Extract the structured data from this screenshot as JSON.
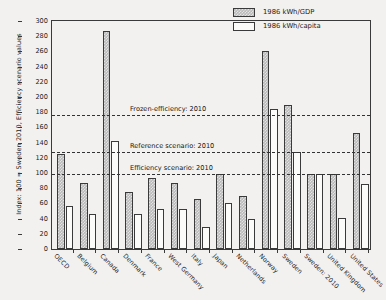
{
  "chart_data": {
    "type": "bar",
    "title": "",
    "xlabel": "",
    "ylabel": "Index: 100 = Sweden 2010, Efficiency scenario values",
    "ylim": [
      0,
      300
    ],
    "yticks": [
      0,
      20,
      40,
      60,
      80,
      100,
      120,
      140,
      160,
      180,
      200,
      220,
      240,
      260,
      280,
      300
    ],
    "grid": false,
    "legend_position": "top-right",
    "categories": [
      "OECD",
      "Belgium",
      "Canada",
      "Denmark",
      "France",
      "West Germany",
      "Italy",
      "Japan",
      "Netherlands",
      "Norway",
      "Sweden",
      "Sweden: 2010",
      "United Kingdom",
      "United States"
    ],
    "series": [
      {
        "name": "1986 kWh/GDP",
        "fill": "hatched-gray",
        "values": [
          125,
          87,
          287,
          75,
          94,
          87,
          66,
          99,
          70,
          260,
          190,
          99,
          99,
          152
        ]
      },
      {
        "name": "1986 kWh/capita",
        "fill": "white",
        "values": [
          57,
          46,
          142,
          46,
          52,
          52,
          29,
          60,
          39,
          184,
          128,
          99,
          41,
          86
        ]
      }
    ],
    "reference_lines": [
      {
        "label": "Frozen-efficiency: 2010",
        "value": 176
      },
      {
        "label": "Reference scenario: 2010",
        "value": 128
      },
      {
        "label": "Efficiency scenario: 2010",
        "value": 99
      }
    ],
    "colors": {
      "gdp_bar": "#b9b9b9",
      "capita_bar": "#fbfbf9",
      "axis": "#3a3a3a",
      "background": "#f2f1ef",
      "text": "#1c1c1c"
    }
  }
}
